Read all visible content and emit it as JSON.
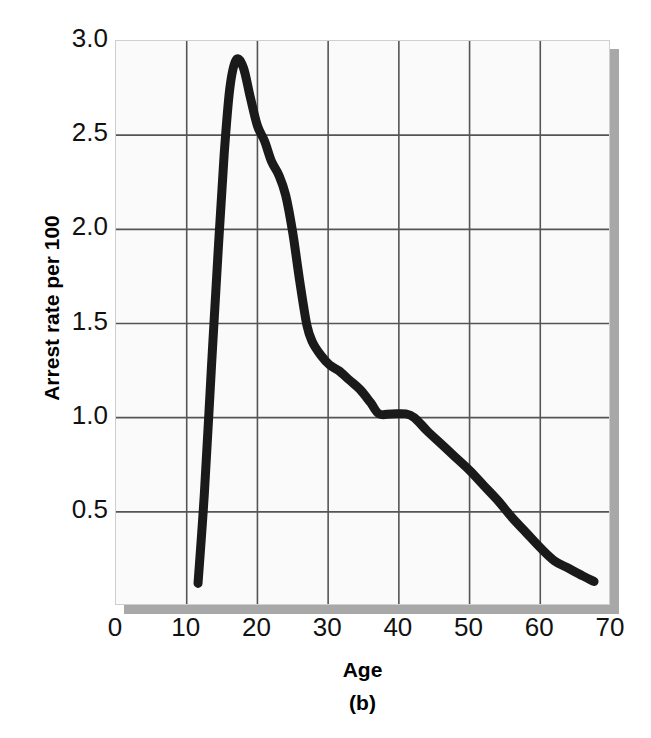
{
  "chart_data": {
    "type": "line",
    "title": "",
    "subtitle": "",
    "panel_label": "(b)",
    "xlabel": "Age",
    "ylabel": "Arrest rate per 100",
    "xlim": [
      0,
      70
    ],
    "ylim": [
      0,
      3.0
    ],
    "xticks": [
      0,
      10,
      20,
      30,
      40,
      50,
      60,
      70
    ],
    "xticklabels": [
      "0",
      "10",
      "20",
      "30",
      "40",
      "50",
      "60",
      "70"
    ],
    "yticks": [
      0.5,
      1.0,
      1.5,
      2.0,
      2.5,
      3.0
    ],
    "yticklabels": [
      "0.5",
      "1.0",
      "1.5",
      "2.0",
      "2.5",
      "3.0"
    ],
    "grid": true,
    "grid_x": true,
    "grid_y": true,
    "legend": "none",
    "line_color": "#1a1a1a",
    "line_width": 9,
    "plot_bg": "#fafafa",
    "grid_color": "#555555",
    "shadow_color": "#a8a8a8",
    "series": [
      {
        "name": "Arrest rate",
        "x": [
          11.6,
          12.5,
          13.5,
          14.5,
          15.3,
          16.1,
          17.0,
          18.0,
          19.0,
          20.0,
          21.0,
          22.0,
          23.0,
          24.0,
          25.0,
          26.0,
          27.0,
          27.8,
          29.0,
          30.2,
          31.5,
          33.0,
          34.5,
          36.0,
          37.2,
          39.0,
          41.0,
          42.2,
          44.0,
          46.0,
          48.0,
          50.0,
          52.0,
          54.0,
          56.0,
          58.0,
          60.0,
          62.0,
          64.0,
          66.0,
          67.6
        ],
        "y": [
          0.12,
          0.6,
          1.27,
          1.92,
          2.4,
          2.75,
          2.9,
          2.86,
          2.7,
          2.55,
          2.47,
          2.36,
          2.29,
          2.18,
          1.98,
          1.72,
          1.49,
          1.4,
          1.33,
          1.28,
          1.25,
          1.2,
          1.15,
          1.08,
          1.02,
          1.02,
          1.02,
          1.0,
          0.93,
          0.86,
          0.79,
          0.72,
          0.64,
          0.56,
          0.47,
          0.39,
          0.31,
          0.24,
          0.2,
          0.16,
          0.13
        ]
      }
    ],
    "annotations": [
      {
        "text": "peak arrest rate ~2.9 at age 17"
      },
      {
        "text": "plateau near 1.0 between ages 37 and 42"
      }
    ]
  }
}
